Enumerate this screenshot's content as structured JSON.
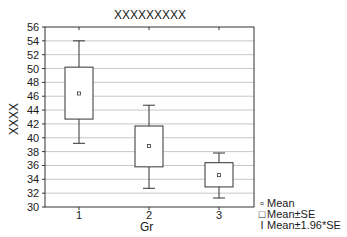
{
  "chart_data": {
    "type": "box",
    "title": "XXXXXXXXX",
    "xlabel": "Gr",
    "ylabel": "XXXX",
    "ylim": [
      30,
      56
    ],
    "yticks": [
      30,
      32,
      34,
      36,
      38,
      40,
      42,
      44,
      46,
      48,
      50,
      52,
      54,
      56
    ],
    "categories": [
      "1",
      "2",
      "3"
    ],
    "grid": true,
    "series": [
      {
        "category": "1",
        "mean": 46.4,
        "mean_minus_se": 42.7,
        "mean_plus_se": 50.2,
        "mean_minus_1_96se": 39.2,
        "mean_plus_1_96se": 54.0
      },
      {
        "category": "2",
        "mean": 38.8,
        "mean_minus_se": 35.8,
        "mean_plus_se": 41.7,
        "mean_minus_1_96se": 32.7,
        "mean_plus_1_96se": 44.7
      },
      {
        "category": "3",
        "mean": 34.6,
        "mean_minus_se": 32.9,
        "mean_plus_se": 36.4,
        "mean_minus_1_96se": 31.3,
        "mean_plus_1_96se": 37.8
      }
    ],
    "legend": {
      "position": "bottom-right",
      "entries": [
        {
          "symbol": "small-square",
          "label": "Mean"
        },
        {
          "symbol": "box",
          "label": "Mean±SE"
        },
        {
          "symbol": "whisker",
          "label": "Mean±1.96*SE"
        }
      ]
    }
  },
  "colors": {
    "axis": "#333333",
    "grid": "#c8c8c8",
    "box": "#333333"
  }
}
